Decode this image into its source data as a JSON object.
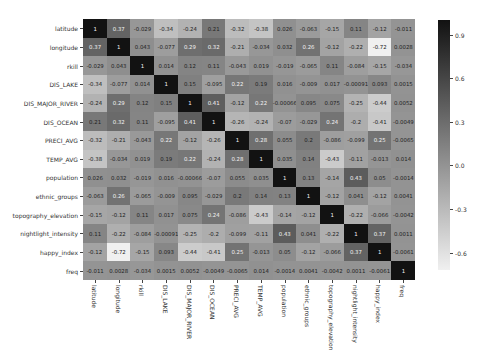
{
  "chart_data": {
    "type": "heatmap",
    "title": "",
    "xlabel": "",
    "ylabel": "",
    "labels": [
      "latitude",
      "longitude",
      "rkill",
      "DIS_LAKE",
      "DIS_MAJOR_RIVER",
      "DIS_OCEAN",
      "PRECI_AVG",
      "TEMP_AVG",
      "population",
      "ethnic_groups",
      "topography_elevation",
      "nightlight_intensity",
      "happy_index",
      "freq"
    ],
    "matrix": [
      [
        1,
        0.37,
        -0.029,
        -0.34,
        -0.24,
        0.21,
        -0.32,
        -0.38,
        0.026,
        -0.063,
        -0.15,
        0.11,
        -0.12,
        -0.011
      ],
      [
        0.37,
        1,
        0.043,
        -0.077,
        0.29,
        0.32,
        -0.21,
        -0.034,
        0.032,
        0.26,
        -0.12,
        -0.22,
        -0.72,
        0.0028
      ],
      [
        -0.029,
        0.043,
        1,
        0.014,
        0.12,
        0.11,
        -0.043,
        0.019,
        -0.019,
        -0.065,
        0.11,
        -0.084,
        -0.15,
        -0.034
      ],
      [
        -0.34,
        -0.077,
        0.014,
        1,
        0.15,
        -0.095,
        0.22,
        0.19,
        0.016,
        -0.009,
        0.017,
        -0.00091,
        0.093,
        0.0015
      ],
      [
        -0.24,
        0.29,
        0.12,
        0.15,
        1,
        0.41,
        -0.12,
        0.22,
        -0.00066,
        0.095,
        0.075,
        -0.25,
        -0.44,
        0.0052
      ],
      [
        0.21,
        0.32,
        0.11,
        -0.095,
        0.41,
        1,
        -0.26,
        -0.24,
        -0.07,
        -0.029,
        0.24,
        -0.2,
        -0.41,
        -0.0049
      ],
      [
        -0.32,
        -0.21,
        -0.043,
        0.22,
        -0.12,
        -0.26,
        1,
        0.28,
        0.055,
        0.2,
        -0.086,
        -0.099,
        0.25,
        -0.0065
      ],
      [
        -0.38,
        -0.034,
        0.019,
        0.19,
        0.22,
        -0.24,
        0.28,
        1,
        0.035,
        0.14,
        -0.43,
        -0.11,
        -0.013,
        0.014
      ],
      [
        0.026,
        0.032,
        -0.019,
        0.016,
        -0.00066,
        -0.07,
        0.055,
        0.035,
        1,
        0.13,
        -0.14,
        0.43,
        0.05,
        -0.0014
      ],
      [
        -0.063,
        0.26,
        -0.065,
        -0.009,
        0.095,
        -0.029,
        0.2,
        0.14,
        0.13,
        1,
        -0.12,
        0.041,
        -0.12,
        0.0041
      ],
      [
        -0.15,
        -0.12,
        0.11,
        0.017,
        0.075,
        0.24,
        -0.086,
        -0.43,
        -0.14,
        -0.12,
        1,
        -0.22,
        -0.066,
        -0.0042
      ],
      [
        0.11,
        -0.22,
        -0.084,
        -0.00091,
        -0.25,
        -0.2,
        -0.099,
        -0.11,
        0.43,
        0.041,
        -0.22,
        1,
        0.37,
        0.0011
      ],
      [
        -0.12,
        -0.72,
        -0.15,
        0.093,
        -0.44,
        -0.41,
        0.25,
        -0.013,
        0.05,
        -0.12,
        -0.066,
        0.37,
        1,
        -0.0061
      ],
      [
        -0.011,
        0.0028,
        -0.034,
        0.0015,
        0.0052,
        -0.0049,
        -0.0065,
        0.014,
        -0.0014,
        0.0041,
        -0.0042,
        0.0011,
        -0.0061,
        1
      ]
    ],
    "colorbar": {
      "ticks": [
        "0.9",
        "0.6",
        "0.3",
        "0.0",
        "-0.3",
        "-0.6"
      ],
      "tick_values": [
        0.9,
        0.6,
        0.3,
        0.0,
        -0.3,
        -0.6
      ],
      "vmin": -0.72,
      "vmax": 1.0,
      "cmap": "grayscale (dark = high, light = low)"
    },
    "annotations": "cell values annotated",
    "grid": false,
    "legend_position": "right (colorbar)"
  },
  "colors": {
    "high": "#1a1a1a",
    "low": "#f0f0f0"
  }
}
